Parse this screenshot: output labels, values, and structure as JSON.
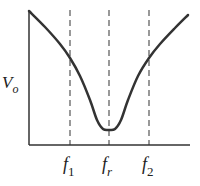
{
  "chart_data": {
    "type": "line",
    "title": "",
    "ylabel": "V_o",
    "ylabel_main": "V",
    "ylabel_sub": "o",
    "xlabel": "",
    "x_ticks": [
      {
        "main": "f",
        "sub": "1",
        "x": 70
      },
      {
        "main": "f",
        "sub": "r",
        "x": 109
      },
      {
        "main": "f",
        "sub": "2",
        "x": 149
      }
    ],
    "curve_points": [
      [
        29,
        11
      ],
      [
        45,
        27
      ],
      [
        60,
        44
      ],
      [
        70,
        58
      ],
      [
        80,
        76
      ],
      [
        90,
        100
      ],
      [
        97,
        120
      ],
      [
        103,
        129
      ],
      [
        109,
        130
      ],
      [
        115,
        129
      ],
      [
        121,
        120
      ],
      [
        128,
        100
      ],
      [
        138,
        76
      ],
      [
        149,
        58
      ],
      [
        160,
        44
      ],
      [
        175,
        28
      ],
      [
        188,
        15
      ]
    ],
    "dashed_lines_x": [
      70,
      109,
      149
    ],
    "grid": false
  },
  "colors": {
    "stroke": "#333333",
    "dash": "#555555"
  }
}
